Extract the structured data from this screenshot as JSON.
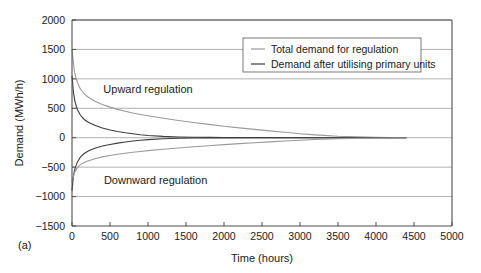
{
  "panel": {
    "label": "(a)"
  },
  "chart_data": {
    "type": "line",
    "title": "",
    "xlabel": "Time (hours)",
    "ylabel": "Demand (MWh/h)",
    "xlim": [
      0,
      5000
    ],
    "ylim": [
      -1500,
      2000
    ],
    "xticks": [
      0,
      500,
      1000,
      1500,
      2000,
      2500,
      3000,
      3500,
      4000,
      4500,
      5000
    ],
    "yticks": [
      -1500,
      -1000,
      -500,
      0,
      500,
      1000,
      1500,
      2000
    ],
    "xtick_labels": [
      "0",
      "500",
      "1000",
      "1500",
      "2000",
      "2500",
      "3000",
      "3500",
      "4000",
      "4500",
      "5000"
    ],
    "ytick_labels": [
      "-1500",
      "-1000",
      "-500",
      "0",
      "500",
      "1000",
      "1500",
      "2000"
    ],
    "grid": true,
    "legend_position": "top-right",
    "annotations": [
      {
        "text": "Upward regulation",
        "x": 1000,
        "y": 760
      },
      {
        "text": "Downward regulation",
        "x": 1100,
        "y": -780
      }
    ],
    "colors": {
      "total_demand": "#9a9a9a",
      "demand_after_primary": "#3c3c3c",
      "grid": "#a8a8a8",
      "axis": "#4d4d4d"
    },
    "series": [
      {
        "name": "Total demand for regulation",
        "color": "#9a9a9a",
        "branch": "upward",
        "x": [
          0,
          30,
          60,
          100,
          150,
          200,
          300,
          400,
          500,
          600,
          700,
          800,
          900,
          1000,
          1200,
          1400,
          1600,
          1800,
          2000,
          2200,
          2400,
          2600,
          2800,
          3000,
          3200,
          3500,
          4000,
          4400
        ],
        "values": [
          1500,
          1140,
          980,
          850,
          760,
          700,
          620,
          565,
          520,
          482,
          450,
          420,
          395,
          372,
          330,
          292,
          258,
          226,
          196,
          168,
          142,
          116,
          92,
          68,
          48,
          24,
          6,
          0
        ]
      },
      {
        "name": "Demand after utilising primary units",
        "color": "#3c3c3c",
        "branch": "upward",
        "x": [
          0,
          20,
          40,
          70,
          110,
          160,
          220,
          300,
          400,
          500,
          600,
          700,
          800,
          900,
          1000,
          1200,
          1400,
          1600,
          1800,
          2000,
          2300,
          2600,
          2900,
          3200,
          3600,
          4000,
          4400
        ],
        "values": [
          1050,
          760,
          610,
          480,
          385,
          310,
          258,
          210,
          165,
          132,
          106,
          84,
          66,
          50,
          38,
          22,
          13,
          8,
          5,
          3,
          2,
          1,
          0,
          0,
          0,
          0,
          0
        ]
      },
      {
        "name": "Demand after utilising primary units",
        "color": "#3c3c3c",
        "branch": "downward",
        "x": [
          0,
          20,
          40,
          70,
          110,
          160,
          220,
          300,
          400,
          500,
          600,
          700,
          800,
          900,
          1000,
          1200,
          1400,
          1600,
          1800,
          2000,
          2300,
          2600,
          2900,
          3200,
          3600,
          4000,
          4400
        ],
        "values": [
          -900,
          -640,
          -520,
          -415,
          -330,
          -268,
          -222,
          -180,
          -142,
          -114,
          -92,
          -72,
          -56,
          -44,
          -32,
          -18,
          -10,
          -6,
          -4,
          -2,
          -1,
          -1,
          0,
          0,
          0,
          0,
          0
        ]
      },
      {
        "name": "Total demand for regulation",
        "color": "#9a9a9a",
        "branch": "downward",
        "x": [
          0,
          30,
          60,
          100,
          150,
          200,
          300,
          400,
          500,
          600,
          700,
          800,
          900,
          1000,
          1200,
          1400,
          1600,
          1800,
          2000,
          2200,
          2400,
          2600,
          2800,
          3000,
          3200,
          3500,
          4000,
          4400
        ],
        "values": [
          -750,
          -600,
          -530,
          -470,
          -428,
          -398,
          -356,
          -326,
          -302,
          -282,
          -264,
          -248,
          -233,
          -220,
          -196,
          -174,
          -154,
          -136,
          -118,
          -101,
          -86,
          -70,
          -56,
          -42,
          -30,
          -15,
          -4,
          0
        ]
      }
    ],
    "legend": [
      {
        "label": "Total demand for regulation",
        "color": "#9a9a9a"
      },
      {
        "label": "Demand after utilising primary units",
        "color": "#3c3c3c"
      }
    ]
  }
}
